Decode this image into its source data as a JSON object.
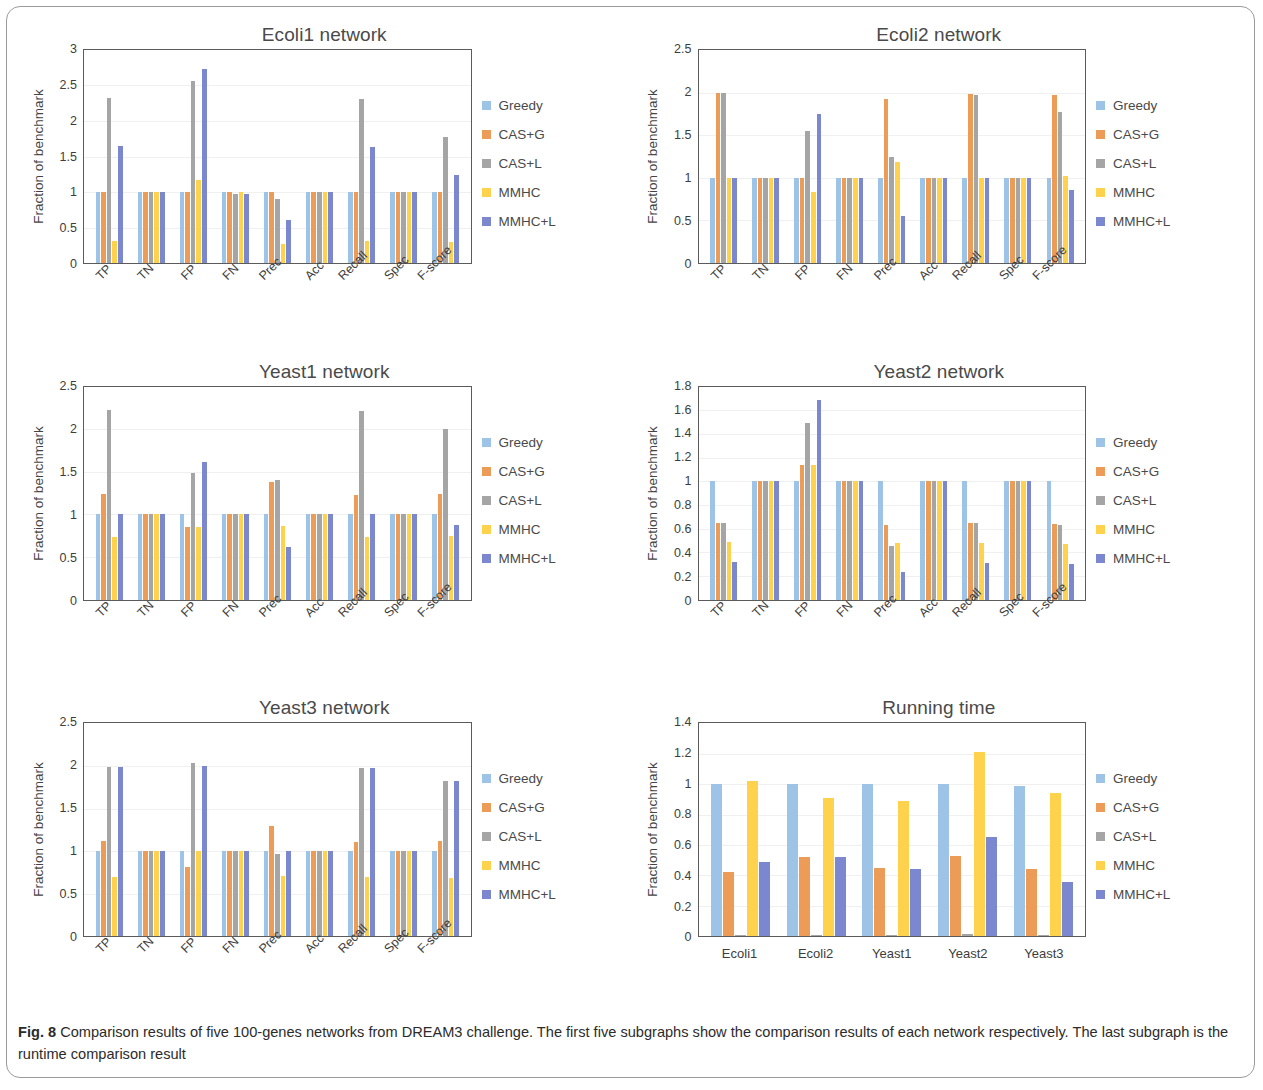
{
  "figure": {
    "caption_label": "Fig. 8",
    "caption_text": "Comparison results of five 100-genes networks from DREAM3 challenge. The first five subgraphs show the comparison results of each network respectively. The last subgraph is the runtime comparison result"
  },
  "series_names": [
    "Greedy",
    "CAS+G",
    "CAS+L",
    "MMHC",
    "MMHC+L"
  ],
  "colors": {
    "greedy": "#9DC3E6",
    "cas_g": "#ED9C58",
    "cas_l": "#A5A5A5",
    "mmhc": "#FFD24D",
    "mmhc_l": "#7B87CE",
    "axis": "#5b5b5b",
    "text": "#3d3d3d",
    "frame": "#9a9a9a"
  },
  "metric_categories": [
    "TP",
    "TN",
    "FP",
    "FN",
    "Prec",
    "Acc",
    "Recall",
    "Spec",
    "F-score"
  ],
  "chart_data": [
    {
      "id": "ecoli1",
      "type": "bar",
      "title": "Ecoli1 network",
      "xlabel": "",
      "ylabel": "Fraction of  benchmark",
      "ylim": [
        0,
        3
      ],
      "yticks": [
        "0",
        "0.5",
        "1",
        "1.5",
        "2",
        "2.5",
        "3"
      ],
      "grid": true,
      "legend_position": "right",
      "categories": [
        "TP",
        "TN",
        "FP",
        "FN",
        "Prec",
        "Acc",
        "Recall",
        "Spec",
        "F-score"
      ],
      "series": [
        {
          "name": "Greedy",
          "values": [
            1.0,
            1.0,
            1.0,
            1.0,
            1.0,
            1.0,
            1.0,
            1.0,
            1.0
          ]
        },
        {
          "name": "CAS+G",
          "values": [
            1.0,
            1.0,
            1.0,
            1.0,
            1.0,
            1.0,
            1.0,
            1.0,
            1.0
          ]
        },
        {
          "name": "CAS+L",
          "values": [
            2.33,
            1.0,
            2.56,
            0.97,
            0.9,
            1.0,
            2.31,
            1.0,
            1.77
          ]
        },
        {
          "name": "MMHC",
          "values": [
            0.31,
            1.0,
            1.17,
            1.0,
            0.27,
            1.0,
            0.31,
            1.0,
            0.29
          ]
        },
        {
          "name": "MMHC+L",
          "values": [
            1.65,
            1.0,
            2.73,
            0.97,
            0.6,
            1.0,
            1.64,
            1.0,
            1.24
          ]
        }
      ]
    },
    {
      "id": "ecoli2",
      "type": "bar",
      "title": "Ecoli2 network",
      "xlabel": "",
      "ylabel": "Fraction of  benchmark",
      "ylim": [
        0,
        2.5
      ],
      "yticks": [
        "0",
        "0.5",
        "1",
        "1.5",
        "2",
        "2.5"
      ],
      "grid": true,
      "legend_position": "right",
      "categories": [
        "TP",
        "TN",
        "FP",
        "FN",
        "Prec",
        "Acc",
        "Recall",
        "Spec",
        "F-score"
      ],
      "series": [
        {
          "name": "Greedy",
          "values": [
            1.0,
            1.0,
            1.0,
            1.0,
            1.0,
            1.0,
            1.0,
            1.0,
            1.0
          ]
        },
        {
          "name": "CAS+G",
          "values": [
            2.0,
            1.0,
            1.0,
            1.0,
            1.92,
            1.0,
            1.98,
            1.0,
            1.97
          ]
        },
        {
          "name": "CAS+L",
          "values": [
            1.99,
            1.0,
            1.55,
            1.0,
            1.24,
            1.0,
            1.97,
            1.0,
            1.77
          ]
        },
        {
          "name": "MMHC",
          "values": [
            1.0,
            1.0,
            0.83,
            1.0,
            1.18,
            1.0,
            1.0,
            1.0,
            1.02
          ]
        },
        {
          "name": "MMHC+L",
          "values": [
            1.0,
            1.0,
            1.75,
            1.0,
            0.55,
            1.0,
            1.0,
            1.0,
            0.86
          ]
        }
      ]
    },
    {
      "id": "yeast1",
      "type": "bar",
      "title": "Yeast1 network",
      "xlabel": "",
      "ylabel": "Fraction of benchmark",
      "ylim": [
        0,
        2.5
      ],
      "yticks": [
        "0",
        "0.5",
        "1",
        "1.5",
        "2",
        "2.5"
      ],
      "grid": true,
      "legend_position": "right",
      "categories": [
        "TP",
        "TN",
        "FP",
        "FN",
        "Prec",
        "Acc",
        "Recall",
        "Spec",
        "F-score"
      ],
      "series": [
        {
          "name": "Greedy",
          "values": [
            1.0,
            1.0,
            1.0,
            1.0,
            1.0,
            1.0,
            1.0,
            1.0,
            1.0
          ]
        },
        {
          "name": "CAS+G",
          "values": [
            1.24,
            1.0,
            0.85,
            1.0,
            1.38,
            1.0,
            1.23,
            1.0,
            1.24
          ]
        },
        {
          "name": "CAS+L",
          "values": [
            2.23,
            1.0,
            1.49,
            1.0,
            1.41,
            1.0,
            2.22,
            1.0,
            2.0
          ]
        },
        {
          "name": "MMHC",
          "values": [
            0.74,
            1.0,
            0.85,
            1.0,
            0.87,
            1.0,
            0.74,
            1.0,
            0.75
          ]
        },
        {
          "name": "MMHC+L",
          "values": [
            1.0,
            1.0,
            1.62,
            1.0,
            0.62,
            1.0,
            1.0,
            1.0,
            0.88
          ]
        }
      ]
    },
    {
      "id": "yeast2",
      "type": "bar",
      "title": "Yeast2 network",
      "xlabel": "",
      "ylabel": "Fraction of  benchmark",
      "ylim": [
        0,
        1.8
      ],
      "yticks": [
        "0",
        "0.2",
        "0.4",
        "0.6",
        "0.8",
        "1",
        "1.2",
        "1.4",
        "1.6",
        "1.8"
      ],
      "grid": true,
      "legend_position": "right",
      "categories": [
        "TP",
        "TN",
        "FP",
        "FN",
        "Prec",
        "Acc",
        "Recall",
        "Spec",
        "F-score"
      ],
      "series": [
        {
          "name": "Greedy",
          "values": [
            1.0,
            1.0,
            1.0,
            1.0,
            1.0,
            1.0,
            1.0,
            1.0,
            1.0
          ]
        },
        {
          "name": "CAS+G",
          "values": [
            0.65,
            1.0,
            1.14,
            1.0,
            0.63,
            1.0,
            0.65,
            1.0,
            0.64
          ]
        },
        {
          "name": "CAS+L",
          "values": [
            0.65,
            1.0,
            1.49,
            1.0,
            0.45,
            1.0,
            0.65,
            1.0,
            0.63
          ]
        },
        {
          "name": "MMHC",
          "values": [
            0.49,
            1.0,
            1.14,
            1.0,
            0.48,
            1.0,
            0.48,
            1.0,
            0.47
          ]
        },
        {
          "name": "MMHC+L",
          "values": [
            0.32,
            1.0,
            1.69,
            1.0,
            0.23,
            1.0,
            0.31,
            1.0,
            0.3
          ]
        }
      ]
    },
    {
      "id": "yeast3",
      "type": "bar",
      "title": "Yeast3 network",
      "xlabel": "",
      "ylabel": "Fraction of benchmark",
      "ylim": [
        0,
        2.5
      ],
      "yticks": [
        "0",
        "0.5",
        "1",
        "1.5",
        "2",
        "2.5"
      ],
      "grid": true,
      "legend_position": "right",
      "categories": [
        "TP",
        "TN",
        "FP",
        "FN",
        "Prec",
        "Acc",
        "Recall",
        "Spec",
        "F-score"
      ],
      "series": [
        {
          "name": "Greedy",
          "values": [
            1.0,
            1.0,
            1.0,
            1.0,
            1.0,
            1.0,
            1.0,
            1.0,
            1.0
          ]
        },
        {
          "name": "CAS+G",
          "values": [
            1.12,
            1.0,
            0.81,
            1.0,
            1.3,
            1.0,
            1.11,
            1.0,
            1.12
          ]
        },
        {
          "name": "CAS+L",
          "values": [
            1.99,
            1.0,
            2.03,
            1.0,
            0.97,
            1.0,
            1.98,
            1.0,
            1.82
          ]
        },
        {
          "name": "MMHC",
          "values": [
            0.7,
            1.0,
            1.0,
            1.0,
            0.71,
            1.0,
            0.7,
            1.0,
            0.69
          ]
        },
        {
          "name": "MMHC+L",
          "values": [
            1.99,
            1.0,
            2.0,
            1.0,
            1.0,
            1.0,
            1.97,
            1.0,
            1.82
          ]
        }
      ]
    },
    {
      "id": "running_time",
      "type": "bar",
      "title": "Running time",
      "xlabel": "",
      "ylabel": "Fraction of benchmark",
      "ylim": [
        0,
        1.4
      ],
      "yticks": [
        "0",
        "0.2",
        "0.4",
        "0.6",
        "0.8",
        "1",
        "1.2",
        "1.4"
      ],
      "grid": true,
      "legend_position": "right",
      "categories": [
        "Ecoli1",
        "Ecoli2",
        "Yeast1",
        "Yeast2",
        "Yeast3"
      ],
      "series": [
        {
          "name": "Greedy",
          "values": [
            1.0,
            1.0,
            1.0,
            1.0,
            0.99
          ]
        },
        {
          "name": "CAS+G",
          "values": [
            0.42,
            0.52,
            0.45,
            0.53,
            0.44
          ]
        },
        {
          "name": "CAS+L",
          "values": [
            0.01,
            0.01,
            0.01,
            0.015,
            0.008
          ]
        },
        {
          "name": "MMHC",
          "values": [
            1.02,
            0.91,
            0.89,
            1.21,
            0.94
          ]
        },
        {
          "name": "MMHC+L",
          "values": [
            0.49,
            0.52,
            0.44,
            0.65,
            0.36
          ]
        }
      ]
    }
  ]
}
